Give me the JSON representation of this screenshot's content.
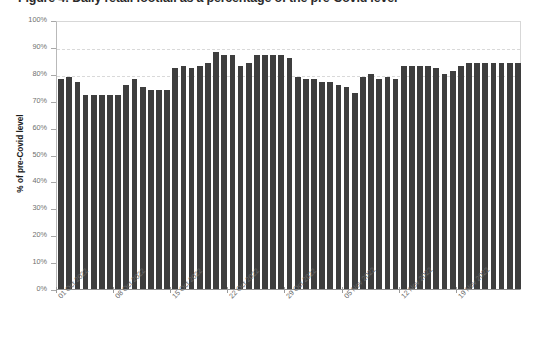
{
  "title": {
    "text": "Figure 4: Daily retail footfall as a percentage of the pre-Covid level"
  },
  "chart_data": {
    "type": "bar",
    "title": "",
    "xlabel": "",
    "ylabel": "% of pre-Covid level",
    "ylim": [
      0,
      100
    ],
    "ytick_labels": [
      "0%",
      "10%",
      "20%",
      "30%",
      "40%",
      "50%",
      "60%",
      "70%",
      "80%",
      "90%",
      "100%"
    ],
    "ytick_values": [
      0,
      10,
      20,
      30,
      40,
      50,
      60,
      70,
      80,
      90,
      100
    ],
    "gridlines": [
      "80%",
      "90%"
    ],
    "grid": true,
    "legend": "none",
    "bar_color": "#3e3e3e",
    "xtick_labels": [
      "01 Oct 2022",
      "08 Oct 2022",
      "15 Oct 2022",
      "22 Oct 2022",
      "29 Oct 2022",
      "05 Nov 2022",
      "12 Nov 2022",
      "19 Nov 2022"
    ],
    "xtick_indices": [
      0,
      7,
      14,
      21,
      28,
      35,
      42,
      49
    ],
    "categories": [
      "01 Oct 2022",
      "02 Oct 2022",
      "03 Oct 2022",
      "04 Oct 2022",
      "05 Oct 2022",
      "06 Oct 2022",
      "07 Oct 2022",
      "08 Oct 2022",
      "09 Oct 2022",
      "10 Oct 2022",
      "11 Oct 2022",
      "12 Oct 2022",
      "13 Oct 2022",
      "14 Oct 2022",
      "15 Oct 2022",
      "16 Oct 2022",
      "17 Oct 2022",
      "18 Oct 2022",
      "19 Oct 2022",
      "20 Oct 2022",
      "21 Oct 2022",
      "22 Oct 2022",
      "23 Oct 2022",
      "24 Oct 2022",
      "25 Oct 2022",
      "26 Oct 2022",
      "27 Oct 2022",
      "28 Oct 2022",
      "29 Oct 2022",
      "30 Oct 2022",
      "31 Oct 2022",
      "01 Nov 2022",
      "02 Nov 2022",
      "03 Nov 2022",
      "04 Nov 2022",
      "05 Nov 2022",
      "06 Nov 2022",
      "07 Nov 2022",
      "08 Nov 2022",
      "09 Nov 2022",
      "10 Nov 2022",
      "11 Nov 2022",
      "12 Nov 2022",
      "13 Nov 2022",
      "14 Nov 2022",
      "15 Nov 2022",
      "16 Nov 2022",
      "17 Nov 2022",
      "18 Nov 2022",
      "19 Nov 2022",
      "20 Nov 2022",
      "21 Nov 2022",
      "22 Nov 2022",
      "23 Nov 2022",
      "24 Nov 2022",
      "25 Nov 2022",
      "26 Nov 2022"
    ],
    "values": [
      78,
      79,
      77,
      72,
      72,
      72,
      72,
      72,
      76,
      78,
      75,
      74,
      74,
      74,
      82,
      83,
      82,
      83,
      84,
      88,
      87,
      87,
      83,
      84,
      87,
      87,
      87,
      87,
      86,
      79,
      78,
      78,
      77,
      77,
      76,
      75,
      73,
      79,
      80,
      78,
      79,
      78,
      83,
      83,
      83,
      83,
      82,
      80,
      81,
      83,
      84,
      84,
      84,
      84,
      84,
      84,
      84
    ]
  }
}
